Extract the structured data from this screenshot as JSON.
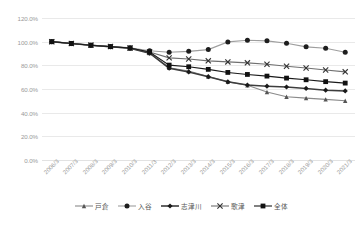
{
  "chart_data": {
    "type": "line",
    "title": "",
    "subtitle": "",
    "xlabel": "",
    "ylabel": "",
    "ylim": [
      0,
      120
    ],
    "ytick_labels": [
      "120.0%",
      "100.0%",
      "80.0%",
      "60.0%",
      "40.0%",
      "20.0%",
      "0.0%"
    ],
    "ytick_values": [
      120,
      100,
      80,
      60,
      40,
      20,
      0
    ],
    "grid": true,
    "legend_position": "bottom",
    "categories": [
      "2006/3",
      "2007/3",
      "2008/3",
      "2009/3",
      "2010/3",
      "2011/3",
      "2012/3",
      "2013/3",
      "2014/3",
      "2015/3",
      "2016/3",
      "2017/3",
      "2018/3",
      "2019/3",
      "2020/3",
      "2021/3"
    ],
    "series": [
      {
        "name": "戸倉",
        "marker": "triangle",
        "color": "#8a8a8a",
        "values": [
          100.0,
          98.4,
          96.9,
          95.6,
          94.4,
          90.4,
          78.0,
          75.2,
          70.5,
          66.0,
          63.2,
          57.5,
          53.5,
          52.3,
          51.2,
          50.1
        ]
      },
      {
        "name": "入谷",
        "marker": "circle",
        "color": "#9e9e9e",
        "values": [
          100.0,
          98.5,
          97.0,
          96.0,
          94.8,
          92.3,
          91.0,
          91.8,
          93.3,
          99.8,
          101.2,
          100.7,
          98.6,
          95.6,
          94.5,
          91.0
        ]
      },
      {
        "name": "志津川",
        "marker": "diamond",
        "color": "#3d3d3d",
        "values": [
          100.0,
          98.4,
          96.9,
          95.6,
          94.4,
          90.2,
          77.6,
          74.4,
          70.4,
          66.1,
          63.4,
          62.4,
          61.7,
          60.5,
          59.0,
          58.4
        ]
      },
      {
        "name": "歌津",
        "marker": "x",
        "color": "#707070",
        "values": [
          100.0,
          98.5,
          97.1,
          95.9,
          94.6,
          91.2,
          86.3,
          85.4,
          83.8,
          82.9,
          82.1,
          80.9,
          79.2,
          77.7,
          76.1,
          74.5
        ]
      },
      {
        "name": "全体",
        "marker": "square",
        "color": "#1a1a1a",
        "values": [
          100.0,
          98.5,
          97.0,
          95.8,
          94.6,
          91.3,
          80.2,
          78.8,
          76.6,
          74.0,
          72.3,
          70.9,
          69.2,
          67.8,
          66.2,
          65.0
        ]
      }
    ]
  }
}
